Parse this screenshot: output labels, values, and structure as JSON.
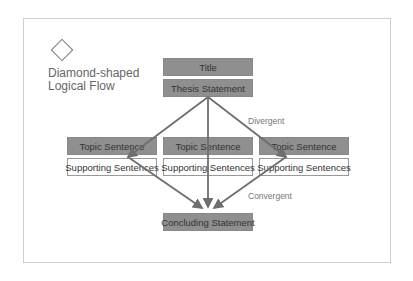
{
  "heading": {
    "line1": "Diamond-shaped",
    "line2": "Logical Flow",
    "icon": "diamond-icon"
  },
  "boxes": {
    "title": "Title",
    "thesis": "Thesis Statement",
    "topics": [
      {
        "topic": "Topic Sentence",
        "support": "Supporting Sentences"
      },
      {
        "topic": "Topic Sentence",
        "support": "Supporting Sentences"
      },
      {
        "topic": "Topic Sentence",
        "support": "Supporting Sentences"
      }
    ],
    "concluding": "Concluding Statement"
  },
  "labels": {
    "divergent": "Divergent",
    "convergent": "Convergent"
  },
  "colors": {
    "box_fill": "#8f8f8f",
    "arrow": "#6e6e6e",
    "frame": "#cfcfcf"
  }
}
